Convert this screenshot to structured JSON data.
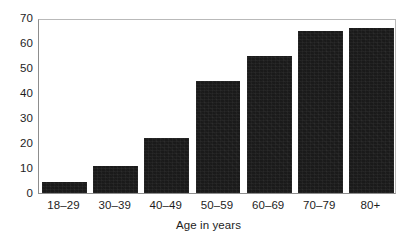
{
  "chart_data": {
    "type": "bar",
    "title": "",
    "subtitle": "",
    "xlabel": "Age in years",
    "ylabel": "",
    "categories": [
      "18–29",
      "30–39",
      "40–49",
      "50–59",
      "60–69",
      "70–79",
      "80+"
    ],
    "values": [
      4.5,
      11,
      22,
      45,
      55,
      65,
      66
    ],
    "series": [
      {
        "name": "",
        "values": [
          4.5,
          11,
          22,
          45,
          55,
          65,
          66
        ]
      }
    ],
    "ylim": [
      0,
      70
    ],
    "yticks": [
      0,
      10,
      20,
      30,
      40,
      50,
      60,
      70
    ],
    "ytick_labels": [
      "0",
      "10",
      "20",
      "30",
      "40",
      "50",
      "60",
      "70"
    ],
    "xtick_labels": [
      "18–29",
      "30–39",
      "40–49",
      "50–59",
      "60–69",
      "70–79",
      "80+"
    ],
    "grid": false,
    "legend": null,
    "legend_position": "none",
    "annotations": [],
    "bar_color": "#1a1a1a",
    "plot_background": "#ffffff",
    "axis_color": "#8d8d8d",
    "text_color": "#1d1d1d"
  }
}
